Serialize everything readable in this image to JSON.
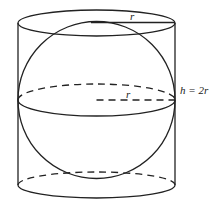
{
  "figure": {
    "labels": {
      "top_radius": "r",
      "equator_radius": "r",
      "height": "h = 2r"
    },
    "colors": {
      "stroke": "#222222",
      "background": "#ffffff"
    }
  }
}
